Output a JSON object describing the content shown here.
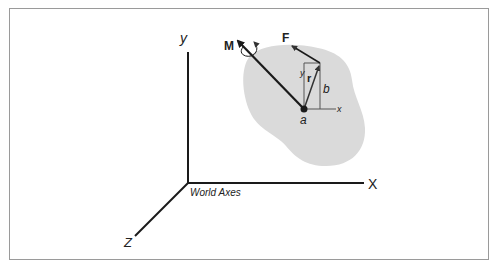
{
  "figure": {
    "type": "3D rigid body force/moment diagram",
    "world_axes": {
      "caption": "World Axes",
      "x_label": "X",
      "y_label": "y",
      "z_label": "Z"
    },
    "body": {
      "moment_label": "M",
      "force_label": "F",
      "position_vector_label": "r",
      "point_label": "a",
      "offset_label": "b",
      "local_x_label": "x",
      "local_y_label": "y"
    },
    "colors": {
      "body_fill": "#dadada",
      "line": "#1a1a1a",
      "thin_line": "#444444",
      "frame_border": "#9a9a9a"
    }
  }
}
